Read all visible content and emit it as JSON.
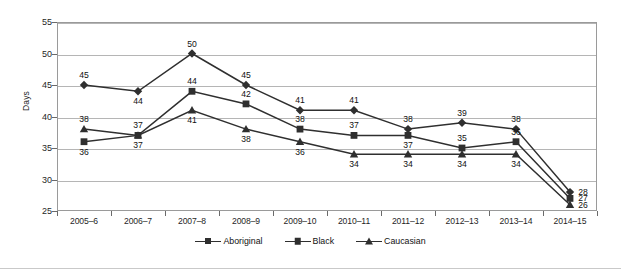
{
  "chart_data": {
    "type": "line",
    "title": "",
    "xlabel": "",
    "ylabel": "Days",
    "ylim": [
      25,
      55
    ],
    "yticks": [
      25,
      30,
      35,
      40,
      45,
      50,
      55
    ],
    "grid": true,
    "legend_position": "bottom-center",
    "categories": [
      "2005–6",
      "2006–7",
      "2007–8",
      "2008–9",
      "2009–10",
      "2010–11",
      "2011–12",
      "2012–13",
      "2013–14",
      "2014–15"
    ],
    "series": [
      {
        "name": "Aboriginal",
        "marker": "diamond",
        "color": "#2f2f2f",
        "values": [
          45,
          44,
          50,
          45,
          41,
          41,
          38,
          39,
          38,
          28
        ],
        "label_positions": [
          "above",
          "below",
          "above",
          "above",
          "above",
          "above",
          "above",
          "above",
          "above",
          "right"
        ]
      },
      {
        "name": "Black",
        "marker": "square",
        "color": "#2f2f2f",
        "values": [
          36,
          37,
          44,
          42,
          38,
          37,
          37,
          35,
          36,
          27
        ],
        "label_positions": [
          "below",
          "below",
          "above",
          "above",
          "above",
          "above",
          "below",
          "above",
          "above",
          "right"
        ]
      },
      {
        "name": "Caucasian",
        "marker": "triangle",
        "color": "#2f2f2f",
        "values": [
          38,
          37,
          41,
          38,
          36,
          34,
          34,
          34,
          34,
          26
        ],
        "label_positions": [
          "above",
          "above",
          "below",
          "below",
          "below",
          "below",
          "below",
          "below",
          "below",
          "right"
        ]
      }
    ]
  },
  "legend": {
    "items": [
      {
        "label": "Aboriginal",
        "marker": "diamond"
      },
      {
        "label": "Black",
        "marker": "square"
      },
      {
        "label": "Caucasian",
        "marker": "triangle"
      }
    ]
  }
}
